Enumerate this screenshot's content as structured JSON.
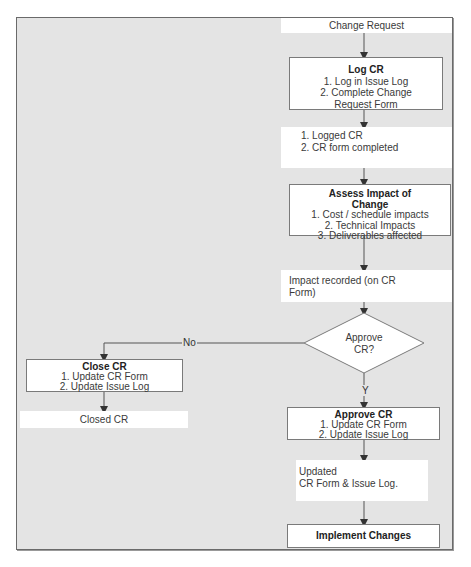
{
  "diagram": {
    "start": {
      "label": "Change Request"
    },
    "log_cr": {
      "title": "Log CR",
      "steps": [
        "1. Log in Issue Log",
        "2. Complete Change",
        "Request Form"
      ]
    },
    "logged_output": {
      "lines": [
        "1. Logged CR",
        "2. CR form completed"
      ]
    },
    "assess": {
      "title_line1": "Assess Impact of",
      "title_line2": "Change",
      "steps": [
        "1. Cost / schedule impacts",
        "2. Technical Impacts",
        "3. Deliverables affected"
      ]
    },
    "impact_output": {
      "lines": [
        "Impact recorded (on CR",
        "Form)"
      ]
    },
    "decision": {
      "line1": "Approve",
      "line2": "CR?"
    },
    "branch_no": {
      "label": "No"
    },
    "branch_yes": {
      "label": "Y"
    },
    "close_cr": {
      "title": "Close CR",
      "steps": [
        "1. Update CR Form",
        "2. Update Issue Log"
      ]
    },
    "closed_output": {
      "label": "Closed CR"
    },
    "approve_cr": {
      "title": "Approve CR",
      "steps": [
        "1. Update CR Form",
        "2. Update Issue Log"
      ]
    },
    "updated_output": {
      "lines": [
        "Updated",
        "CR Form & Issue Log."
      ]
    },
    "implement": {
      "title": "Implement Changes"
    }
  },
  "colors": {
    "background": "#e4e4e4",
    "box_fill": "#ffffff",
    "box_border": "#7a7a7a",
    "line": "#555555"
  }
}
